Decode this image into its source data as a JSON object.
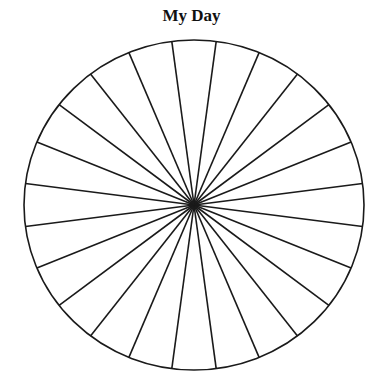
{
  "chart_data": {
    "type": "pie",
    "title": "My Day",
    "categories": [
      "1",
      "2",
      "3",
      "4",
      "5",
      "6",
      "7",
      "8",
      "9",
      "10",
      "11",
      "12",
      "13",
      "14",
      "15",
      "16",
      "17",
      "18",
      "19",
      "20",
      "21",
      "22",
      "23",
      "24"
    ],
    "values": [
      1,
      1,
      1,
      1,
      1,
      1,
      1,
      1,
      1,
      1,
      1,
      1,
      1,
      1,
      1,
      1,
      1,
      1,
      1,
      1,
      1,
      1,
      1,
      1
    ],
    "slice_count": 24,
    "slice_labels_visible": false,
    "legend": "none",
    "start_angle_deg": 7.5,
    "colors": {
      "fill": "#ffffff",
      "stroke": "#1a1a1a"
    }
  },
  "geometry": {
    "cx": 194,
    "cy": 205,
    "rx": 170,
    "ry": 165
  }
}
